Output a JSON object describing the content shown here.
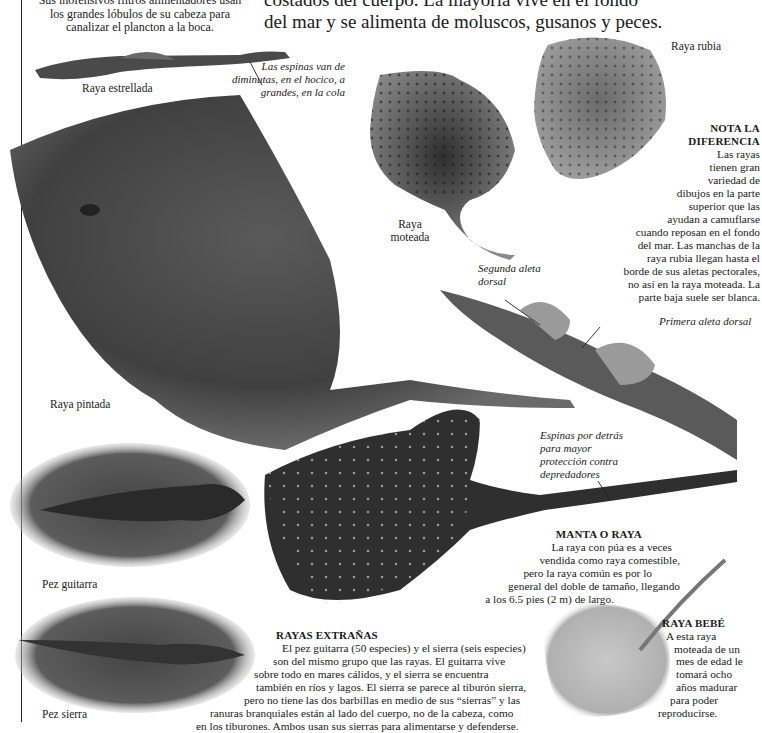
{
  "page": {
    "top_left_text": {
      "lines": [
        "Sus inofensivos filtros alimentadores usan",
        "los grandes lóbulos de su cabeza para",
        "canalizar el plancton a la boca."
      ]
    },
    "top_center_text": {
      "lines": [
        "costados del cuerpo. La mayoría vive en el fondo",
        "del mar y se alimenta de moluscos, gusanos y peces."
      ]
    }
  },
  "captions": {
    "raya_estrellada": "Raya estrellada",
    "raya_rubia": "Raya rubia",
    "raya_moteada": [
      "Raya",
      "moteada"
    ],
    "raya_pintada": "Raya pintada",
    "pez_guitarra": "Pez guitarra",
    "pez_sierra": "Pez sierra"
  },
  "annotations": {
    "espinas_cola": [
      "Las espinas van de",
      "diminutas, en el hocico, a",
      "grandes, en la cola"
    ],
    "segunda_aleta": [
      "Segunda aleta",
      "dorsal"
    ],
    "primera_aleta": "Primera aleta dorsal",
    "espinas_detras": [
      "Espinas por detrás",
      "para mayor",
      "protección contra",
      "depredadores"
    ]
  },
  "sidebars": {
    "nota": {
      "title_lines": [
        "NOTA LA",
        "DIFERENCIA"
      ],
      "lines": [
        "Las rayas",
        "tienen gran",
        "variedad de",
        "dibujos en la parte",
        "superior que las",
        "ayudan a camuflarse",
        "cuando reposan en el fondo",
        "del mar. Las manchas de la",
        "raya rubia llegan hasta el",
        "borde de sus aletas pectorales,",
        "no así en la raya moteada. La",
        "parte baja suele ser blanca."
      ]
    },
    "manta": {
      "title": "MANTA O RAYA",
      "lines": [
        "La raya con púa es a veces",
        "vendida como raya comestible,",
        "pero la raya común es por lo",
        "general del doble de tamaño, llegando",
        "a los 6.5 pies (2 m) de largo."
      ]
    },
    "extranas": {
      "title": "RAYAS EXTRAÑAS",
      "lines": [
        "El pez guitarra (50 especies) y el sierra (seis especies)",
        "son del mismo grupo que las rayas. El guitarra vive",
        "sobre todo en mares cálidos, y el sierra se encuentra",
        "también en ríos y lagos. El sierra se parece al tiburón sierra,",
        "pero no tiene las dos barbillas en medio de sus “sierras” y las",
        "ranuras branquiales están al lado del cuerpo, no de la cabeza, como",
        "en los tiburones. Ambos usan sus sierras para alimentarse y defenderse."
      ]
    },
    "bebe": {
      "title": "RAYA BEBÉ",
      "lines": [
        "A esta raya",
        "moteada de un",
        "mes de edad le",
        "tomará ocho",
        "años madurar",
        "para poder",
        "reproducirse."
      ]
    }
  },
  "colors": {
    "ink": "#1a1a1a",
    "paper": "#ffffff",
    "ray_dark": "#3a3a3a",
    "ray_mid": "#6e6e6e",
    "ray_light": "#a8a8a8"
  }
}
